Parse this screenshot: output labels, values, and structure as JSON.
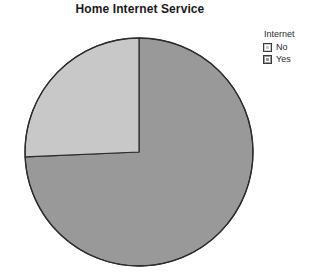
{
  "chart_title": "Home Internet Service",
  "legend": {
    "title": "Internet",
    "items": [
      {
        "label": "No",
        "color": "#c8c8c8",
        "swatch_name": "legend-swatch-no"
      },
      {
        "label": "Yes",
        "color": "#999999",
        "swatch_name": "legend-swatch-yes"
      }
    ]
  },
  "chart_data": {
    "type": "pie",
    "title": "Home Internet Service",
    "legend_title": "Internet",
    "legend_position": "right",
    "categories": [
      "Yes",
      "No"
    ],
    "values": [
      74.3,
      25.7
    ],
    "unit": "percent",
    "start_angle_deg": 0,
    "direction": "clockwise",
    "slices": [
      {
        "label": "Yes",
        "value": 74.3,
        "color": "#999999",
        "start_angle_deg": 0,
        "end_angle_deg": 267.5
      },
      {
        "label": "No",
        "value": 25.7,
        "color": "#c8c8c8",
        "start_angle_deg": 267.5,
        "end_angle_deg": 360
      }
    ],
    "outline_color": "#2b2b2b",
    "grid": false,
    "xlabel": "",
    "ylabel": ""
  },
  "geometry": {
    "center_x": 139,
    "center_y": 132,
    "radius": 114
  }
}
